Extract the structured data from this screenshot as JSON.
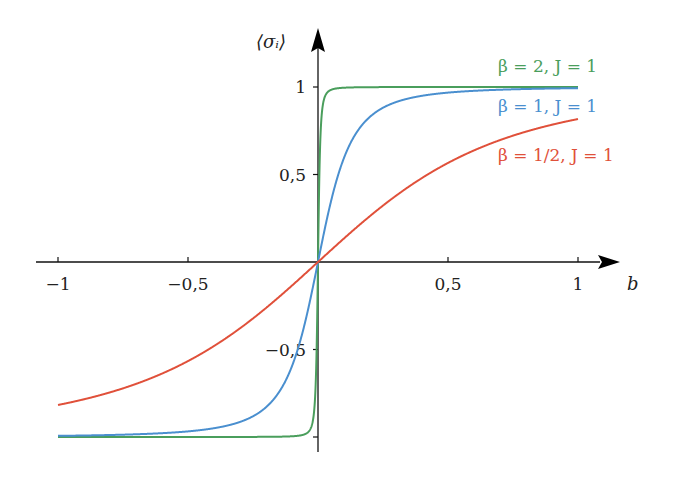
{
  "chart_data": {
    "type": "line",
    "title": "",
    "xlabel": "b",
    "ylabel": "⟨σ_i⟩",
    "xlim": [
      -1,
      1
    ],
    "ylim": [
      -1,
      1
    ],
    "grid": false,
    "legend_position": "inline-right",
    "x_ticks": [
      {
        "value": -1,
        "label": "−1"
      },
      {
        "value": -0.5,
        "label": "−0,5"
      },
      {
        "value": 0.5,
        "label": "0,5"
      },
      {
        "value": 1,
        "label": "1"
      }
    ],
    "y_ticks": [
      {
        "value": 1,
        "label": "1"
      },
      {
        "value": 0.5,
        "label": "0,5"
      },
      {
        "value": -0.5,
        "label": "−0,5"
      },
      {
        "value": -1,
        "label": ""
      }
    ],
    "formula": "⟨σ_i⟩ = sinh(βb) / sqrt(sinh²(βb) + e^(−4βJ))",
    "series": [
      {
        "name": "β = 2, J = 1",
        "beta": 2,
        "J": 1,
        "color": "#4a9e5c",
        "x": [
          -1,
          -0.5,
          -0.1,
          -0.05,
          -0.02,
          0,
          0.02,
          0.05,
          0.1,
          0.5,
          1
        ],
        "values": [
          -1.0,
          -1.0,
          -0.99,
          -0.95,
          -0.72,
          0,
          0.72,
          0.95,
          0.99,
          1.0,
          1.0
        ]
      },
      {
        "name": "β = 1, J = 1",
        "beta": 1,
        "J": 1,
        "color": "#4a8fcf",
        "x": [
          -1,
          -0.5,
          -0.25,
          -0.1,
          0,
          0.1,
          0.25,
          0.5,
          1
        ],
        "values": [
          -0.99,
          -0.97,
          -0.88,
          -0.6,
          0,
          0.6,
          0.88,
          0.97,
          0.99
        ]
      },
      {
        "name": "β = 1/2, J = 1",
        "beta": 0.5,
        "J": 1,
        "color": "#e0503a",
        "x": [
          -1,
          -0.5,
          -0.25,
          0,
          0.25,
          0.5,
          1
        ],
        "values": [
          -0.82,
          -0.57,
          -0.32,
          0,
          0.32,
          0.57,
          0.82
        ]
      }
    ]
  },
  "labels": {
    "y_axis": "⟨σᵢ⟩",
    "x_axis": "b",
    "legend_green": "β = 2, J = 1",
    "legend_blue": "β = 1, J = 1",
    "legend_red": "β = 1/2, J = 1"
  }
}
